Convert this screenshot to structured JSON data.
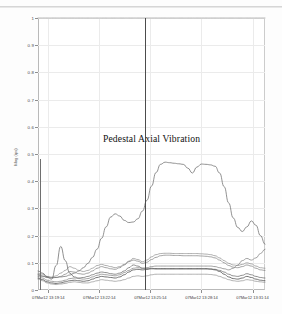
{
  "chart_data": {
    "type": "line",
    "title": "Pedestal Axial Vibration",
    "xlabel": "",
    "ylabel": "Mag (ips)",
    "ylim": [
      0,
      1
    ],
    "grid": true,
    "legend": false,
    "yticks": [
      "0",
      "0.1",
      "0.2",
      "0.3",
      "0.4",
      "0.5",
      "0.6",
      "0.7",
      "0.8",
      "0.9",
      "1"
    ],
    "ytick_values": [
      0,
      0.1,
      0.2,
      0.3,
      0.4,
      0.5,
      0.6,
      0.7,
      0.8,
      0.9,
      1
    ],
    "xticks": [
      "07Mar12 13:19:14",
      "07Mar12 13:22:14",
      "07Mar12 13:25:14",
      "07Mar12 13:28:14",
      "07Mar12 13:31:14"
    ],
    "xtick_positions": [
      0.045,
      0.27,
      0.495,
      0.72,
      0.945
    ],
    "cursor_position": 0.472,
    "cursor_label": "07Mar12 13:25:14",
    "x": [
      0,
      0.02,
      0.04,
      0.06,
      0.08,
      0.1,
      0.12,
      0.14,
      0.16,
      0.18,
      0.2,
      0.22,
      0.24,
      0.26,
      0.28,
      0.3,
      0.32,
      0.34,
      0.36,
      0.38,
      0.4,
      0.42,
      0.44,
      0.46,
      0.48,
      0.5,
      0.52,
      0.54,
      0.56,
      0.58,
      0.6,
      0.62,
      0.64,
      0.66,
      0.68,
      0.7,
      0.72,
      0.74,
      0.76,
      0.78,
      0.8,
      0.82,
      0.84,
      0.86,
      0.88,
      0.9,
      0.92,
      0.94,
      0.96,
      0.98,
      1.0
    ],
    "series": [
      {
        "name": "full-scale-reference",
        "color": "#9a9a9a",
        "width": 0.7,
        "values": [
          1,
          1,
          1,
          1,
          1,
          1,
          1,
          1,
          1,
          1,
          1,
          1,
          1,
          1,
          1,
          1,
          1,
          1,
          1,
          1,
          1,
          1,
          1,
          1,
          1,
          1,
          1,
          1,
          1,
          1,
          1,
          1,
          1,
          1,
          1,
          1,
          1,
          1,
          1,
          1,
          1,
          1,
          1,
          1,
          1,
          1,
          1,
          1,
          1,
          1,
          1
        ]
      },
      {
        "name": "pedestal-axial-primary",
        "color": "#6e6e6e",
        "width": 0.75,
        "values": [
          0.055,
          0.05,
          0.048,
          0.047,
          0.046,
          0.048,
          0.05,
          0.055,
          0.062,
          0.07,
          0.082,
          0.098,
          0.12,
          0.15,
          0.19,
          0.232,
          0.268,
          0.28,
          0.272,
          0.256,
          0.248,
          0.25,
          0.262,
          0.29,
          0.33,
          0.382,
          0.432,
          0.462,
          0.47,
          0.468,
          0.466,
          0.464,
          0.462,
          0.448,
          0.43,
          0.452,
          0.463,
          0.462,
          0.46,
          0.455,
          0.43,
          0.38,
          0.32,
          0.265,
          0.23,
          0.215,
          0.232,
          0.254,
          0.238,
          0.2,
          0.168
        ]
      },
      {
        "name": "trace-upper-plateau",
        "color": "#8b8b8b",
        "width": 0.7,
        "values": [
          0.062,
          0.058,
          0.05,
          0.046,
          0.052,
          0.062,
          0.072,
          0.086,
          0.08,
          0.072,
          0.068,
          0.072,
          0.08,
          0.09,
          0.094,
          0.09,
          0.086,
          0.082,
          0.086,
          0.094,
          0.106,
          0.116,
          0.112,
          0.104,
          0.11,
          0.122,
          0.13,
          0.134,
          0.135,
          0.135,
          0.134,
          0.134,
          0.134,
          0.134,
          0.134,
          0.134,
          0.133,
          0.132,
          0.13,
          0.126,
          0.118,
          0.108,
          0.098,
          0.092,
          0.09,
          0.094,
          0.1,
          0.096,
          0.088,
          0.082,
          0.08
        ]
      },
      {
        "name": "trace-mid-plateau",
        "color": "#7b7b7b",
        "width": 0.7,
        "values": [
          0.058,
          0.052,
          0.046,
          0.044,
          0.046,
          0.05,
          0.058,
          0.068,
          0.066,
          0.06,
          0.058,
          0.062,
          0.07,
          0.08,
          0.086,
          0.082,
          0.078,
          0.076,
          0.082,
          0.092,
          0.104,
          0.11,
          0.106,
          0.098,
          0.102,
          0.112,
          0.12,
          0.126,
          0.128,
          0.128,
          0.127,
          0.127,
          0.126,
          0.126,
          0.126,
          0.126,
          0.125,
          0.124,
          0.122,
          0.118,
          0.11,
          0.1,
          0.09,
          0.084,
          0.082,
          0.086,
          0.092,
          0.088,
          0.08,
          0.074,
          0.072
        ]
      },
      {
        "name": "trace-spike-early",
        "color": "#5f5f5f",
        "width": 0.7,
        "values": [
          0.07,
          0.062,
          0.048,
          0.04,
          0.09,
          0.16,
          0.108,
          0.062,
          0.048,
          0.044,
          0.046,
          0.05,
          0.056,
          0.062,
          0.066,
          0.064,
          0.06,
          0.058,
          0.062,
          0.07,
          0.082,
          0.092,
          0.088,
          0.08,
          0.078,
          0.08,
          0.078,
          0.078,
          0.078,
          0.078,
          0.078,
          0.078,
          0.078,
          0.078,
          0.078,
          0.078,
          0.078,
          0.078,
          0.077,
          0.076,
          0.072,
          0.066,
          0.058,
          0.052,
          0.05,
          0.054,
          0.06,
          0.056,
          0.05,
          0.046,
          0.044
        ]
      },
      {
        "name": "trace-low-steady",
        "color": "#4f4f4f",
        "width": 0.8,
        "values": [
          0.044,
          0.038,
          0.03,
          0.026,
          0.024,
          0.026,
          0.03,
          0.034,
          0.036,
          0.034,
          0.032,
          0.034,
          0.04,
          0.046,
          0.05,
          0.048,
          0.046,
          0.044,
          0.048,
          0.056,
          0.066,
          0.074,
          0.076,
          0.074,
          0.076,
          0.078,
          0.078,
          0.078,
          0.078,
          0.078,
          0.078,
          0.078,
          0.078,
          0.078,
          0.078,
          0.078,
          0.078,
          0.078,
          0.077,
          0.074,
          0.068,
          0.058,
          0.048,
          0.042,
          0.04,
          0.044,
          0.05,
          0.046,
          0.04,
          0.036,
          0.034
        ]
      },
      {
        "name": "trace-baseline",
        "color": "#8f8f8f",
        "width": 0.7,
        "values": [
          0.04,
          0.034,
          0.026,
          0.022,
          0.02,
          0.022,
          0.024,
          0.028,
          0.03,
          0.028,
          0.026,
          0.026,
          0.03,
          0.034,
          0.038,
          0.036,
          0.034,
          0.032,
          0.034,
          0.038,
          0.044,
          0.05,
          0.052,
          0.05,
          0.052,
          0.056,
          0.058,
          0.058,
          0.058,
          0.058,
          0.058,
          0.058,
          0.058,
          0.058,
          0.058,
          0.058,
          0.058,
          0.058,
          0.057,
          0.055,
          0.05,
          0.044,
          0.038,
          0.034,
          0.032,
          0.034,
          0.038,
          0.036,
          0.032,
          0.03,
          0.028
        ]
      },
      {
        "name": "trace-right-rise",
        "color": "#7a7a7a",
        "width": 0.7,
        "values": [
          0.05,
          0.044,
          0.036,
          0.032,
          0.03,
          0.032,
          0.036,
          0.042,
          0.044,
          0.042,
          0.04,
          0.042,
          0.048,
          0.054,
          0.058,
          0.056,
          0.054,
          0.052,
          0.056,
          0.064,
          0.072,
          0.08,
          0.082,
          0.08,
          0.082,
          0.086,
          0.088,
          0.088,
          0.088,
          0.088,
          0.088,
          0.088,
          0.088,
          0.088,
          0.088,
          0.088,
          0.088,
          0.088,
          0.088,
          0.086,
          0.082,
          0.078,
          0.074,
          0.08,
          0.092,
          0.108,
          0.116,
          0.11,
          0.118,
          0.134,
          0.15
        ]
      }
    ],
    "edge_marker": {
      "name": "left-edge-cursor",
      "x": 0.008,
      "y_top": 0.48,
      "y_bottom": 0.0
    }
  }
}
